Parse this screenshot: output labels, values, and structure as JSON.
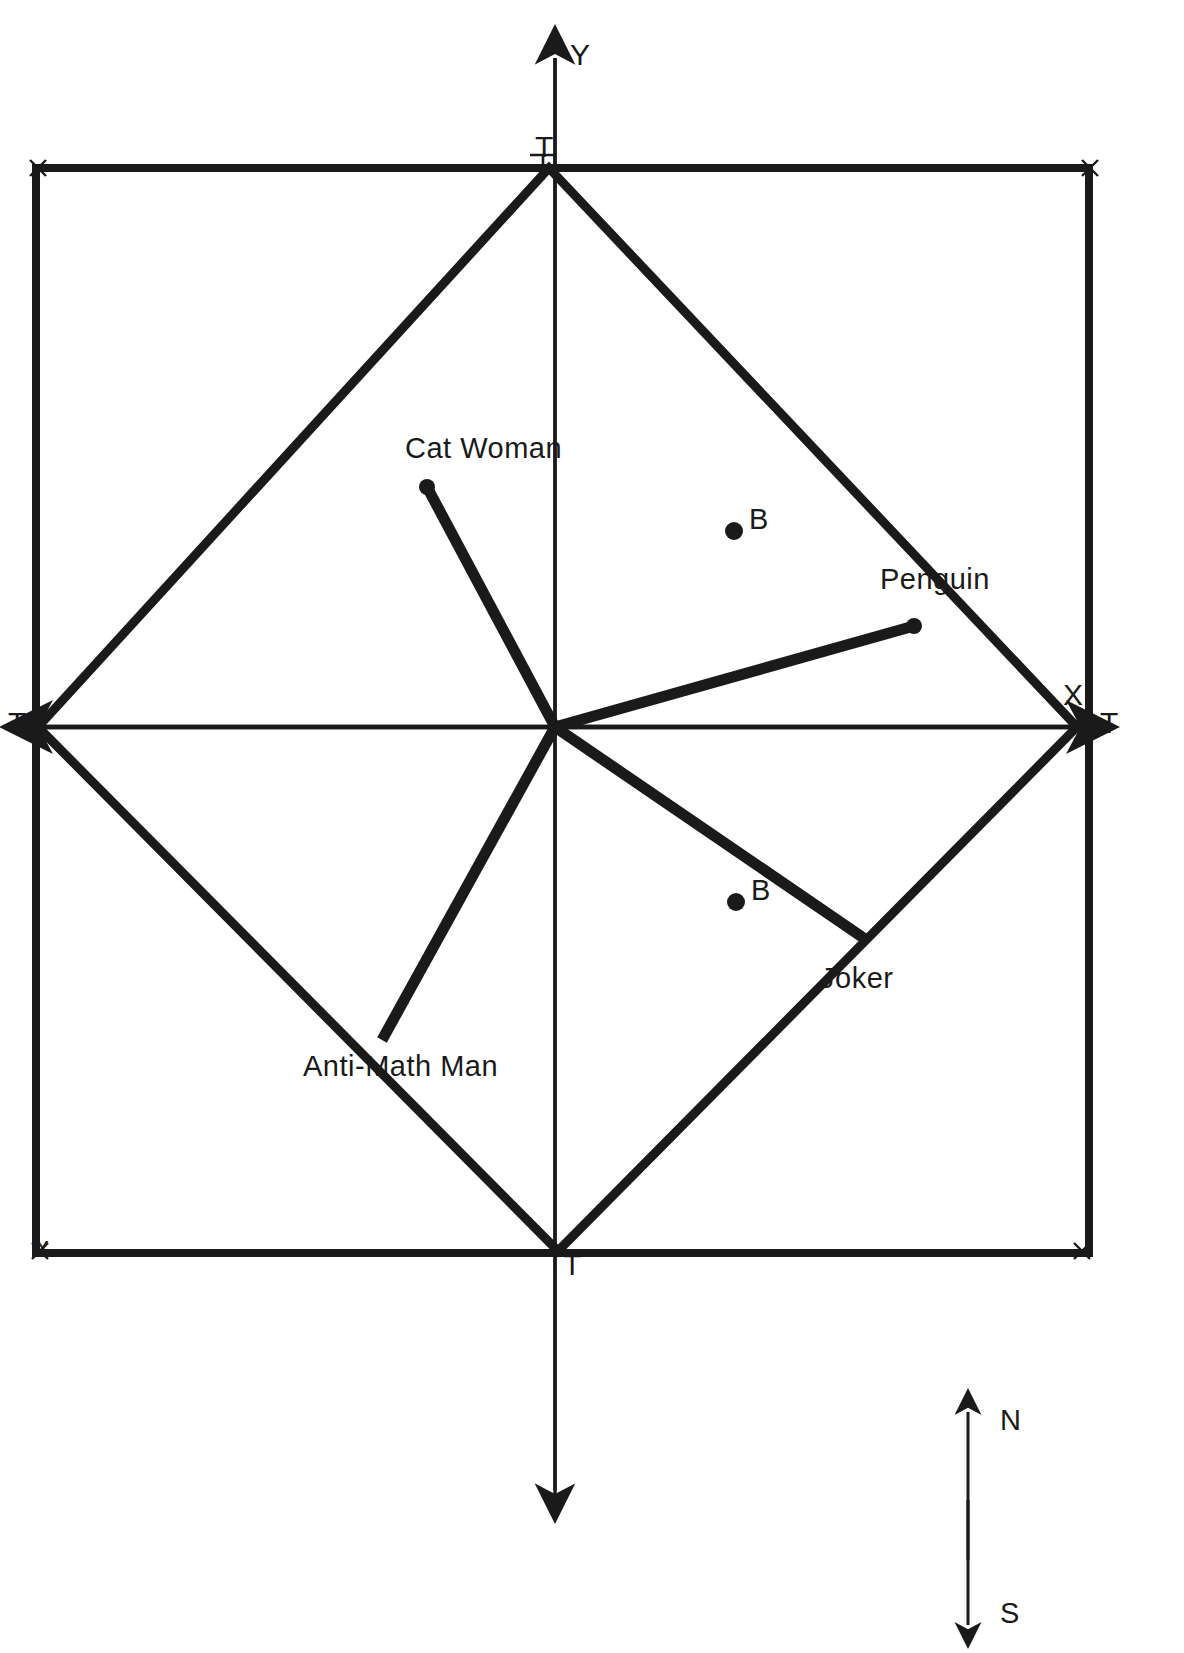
{
  "figure": {
    "kind": "graph-paper-coordinate-plane-diagram",
    "background_color": "#ffffff",
    "ink_color": "#1a1a1a",
    "grid": {
      "minor_color": "#2b2b2b",
      "major_color": "#1a1a1a",
      "minor_spacing_px": 43,
      "major_every": 5,
      "left_px": 36,
      "top_px": 36,
      "right_px": 1089,
      "bottom_px": 1498
    },
    "axes": {
      "x_label": "X",
      "y_label": "Y",
      "origin_px": [
        555,
        727
      ]
    },
    "axis_tip_labels": {
      "left": "T",
      "right": "T",
      "top": "T",
      "bottom": "T"
    },
    "corner_markers": [
      "x",
      "x",
      "x",
      "x"
    ],
    "compass": {
      "north_label": "N",
      "south_label": "S"
    },
    "labels": [
      {
        "name": "cat-woman",
        "text": "Cat Woman",
        "x": 405,
        "y": 432
      },
      {
        "name": "penguin",
        "text": "Penguin",
        "x": 880,
        "y": 563
      },
      {
        "name": "joker",
        "text": "Joker",
        "x": 820,
        "y": 962
      },
      {
        "name": "anti-math-man",
        "text": "Anti-Math Man",
        "x": 303,
        "y": 1050
      },
      {
        "name": "point-b-upper",
        "text": "B",
        "x": 744,
        "y": 503
      },
      {
        "name": "point-b-lower",
        "text": "B",
        "x": 746,
        "y": 874
      },
      {
        "name": "y-axis",
        "text": "Y",
        "x": 570,
        "y": 38
      },
      {
        "name": "x-axis",
        "text": "X",
        "x": 1063,
        "y": 678
      },
      {
        "name": "t-left",
        "text": "T",
        "x": 6,
        "y": 705
      },
      {
        "name": "t-right",
        "text": "T",
        "x": 1100,
        "y": 705
      },
      {
        "name": "t-top",
        "text": "T",
        "x": 537,
        "y": 130
      },
      {
        "name": "t-bottom",
        "text": "T",
        "x": 563,
        "y": 1248
      },
      {
        "name": "compass-north",
        "text": "N",
        "x": 1000,
        "y": 1406
      },
      {
        "name": "compass-south",
        "text": "S",
        "x": 1000,
        "y": 1600
      },
      {
        "name": "corner-tl",
        "text": "x",
        "x": 32,
        "y": 152
      },
      {
        "name": "corner-tr",
        "text": "x",
        "x": 1088,
        "y": 152
      },
      {
        "name": "corner-bl",
        "text": "x",
        "x": 36,
        "y": 1234
      },
      {
        "name": "corner-br",
        "text": "x",
        "x": 1078,
        "y": 1234
      }
    ],
    "dots": [
      {
        "name": "dot-b-upper",
        "x": 734,
        "y": 531
      },
      {
        "name": "dot-b-lower",
        "x": 736,
        "y": 902
      },
      {
        "name": "dot-cat-woman-end",
        "x": 427,
        "y": 487
      },
      {
        "name": "dot-penguin-end",
        "x": 914,
        "y": 626
      }
    ],
    "square_outline": {
      "name": "bounding-square",
      "left": 36,
      "top": 168,
      "right": 1089,
      "bottom": 1253
    },
    "diamond": {
      "name": "rotated-square-diamond",
      "vertices_px": [
        [
          549,
          168
        ],
        [
          1077,
          727
        ],
        [
          558,
          1251
        ],
        [
          38,
          727
        ]
      ]
    },
    "rays": [
      {
        "name": "ray-cat-woman",
        "from": [
          555,
          727
        ],
        "to": [
          427,
          487
        ]
      },
      {
        "name": "ray-penguin",
        "from": [
          555,
          727
        ],
        "to": [
          914,
          626
        ]
      },
      {
        "name": "ray-joker",
        "from": [
          555,
          727
        ],
        "to": [
          868,
          941
        ]
      },
      {
        "name": "ray-anti-math-man",
        "from": [
          555,
          727
        ],
        "to": [
          382,
          1040
        ]
      }
    ]
  }
}
